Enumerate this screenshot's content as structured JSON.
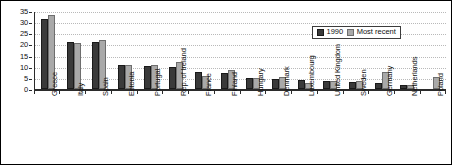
{
  "chart_data": {
    "type": "bar",
    "title": "",
    "subtitle": "",
    "xlabel": "",
    "ylabel": "",
    "ylim": [
      0,
      35
    ],
    "ytick_step": 5,
    "yticks": [
      0,
      5,
      10,
      15,
      20,
      25,
      30,
      35
    ],
    "grid": true,
    "grid_style": "dotted-horizontal",
    "legend_position": "inside-top-right",
    "categories": [
      "Greece",
      "Italy",
      "Spain",
      "Estonia",
      "Portugal",
      "Rep. of Ireland",
      "France",
      "Finland",
      "Hungary",
      "Denmark",
      "Luxembourg",
      "United Kingdom",
      "Sweden",
      "Germany",
      "Netherlands",
      "Poland"
    ],
    "series": [
      {
        "name": "1990",
        "color": "#3a3a3a",
        "values": [
          31.5,
          21.0,
          21.0,
          11.0,
          10.5,
          10.0,
          7.5,
          7.0,
          5.0,
          4.5,
          4.0,
          3.5,
          3.0,
          2.5,
          2.0,
          null
        ]
      },
      {
        "name": "Most recent",
        "color": "#a9a9a9",
        "values": [
          33.0,
          20.8,
          22.0,
          11.0,
          11.0,
          12.0,
          6.0,
          8.5,
          5.0,
          5.5,
          2.5,
          3.5,
          3.5,
          7.5,
          2.0,
          5.5
        ]
      }
    ]
  },
  "legend": {
    "items": [
      {
        "label": "1990"
      },
      {
        "label": "Most recent"
      }
    ]
  }
}
